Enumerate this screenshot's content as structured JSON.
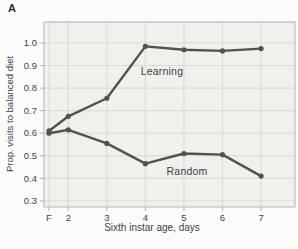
{
  "panel_label": "A",
  "chart_data": {
    "type": "line",
    "title": "",
    "xlabel": "Sixth instar age, days",
    "ylabel": "Prop. visits to balanced diet",
    "x_tick_labels": [
      "F",
      "2",
      "3",
      "4",
      "5",
      "6",
      "7"
    ],
    "x": [
      1.5,
      2,
      3,
      4,
      5,
      6,
      7
    ],
    "xlim": [
      1.37,
      7.88
    ],
    "ylim": [
      0.273,
      1.093
    ],
    "yticks": [
      0.3,
      0.4,
      0.5,
      0.6,
      0.7,
      0.8,
      0.9,
      1.0
    ],
    "grid": true,
    "legend_position": "inline-annotations",
    "series": [
      {
        "name": "Learning",
        "values": [
          0.61,
          0.675,
          0.755,
          0.985,
          0.97,
          0.965,
          0.975
        ],
        "label_pos": {
          "x": 4.43,
          "y": 0.875
        }
      },
      {
        "name": "Random",
        "values": [
          0.6,
          0.615,
          0.555,
          0.465,
          0.51,
          0.505,
          0.41
        ],
        "label_pos": {
          "x": 5.08,
          "y": 0.432
        }
      }
    ],
    "colors": {
      "line": "#57504b",
      "grid": "#d9d8d3",
      "plot_bg": "#f1f0ec",
      "border": "#b3b2ae",
      "text": "#403f3d",
      "page_bg": "#fcfcfb"
    }
  }
}
